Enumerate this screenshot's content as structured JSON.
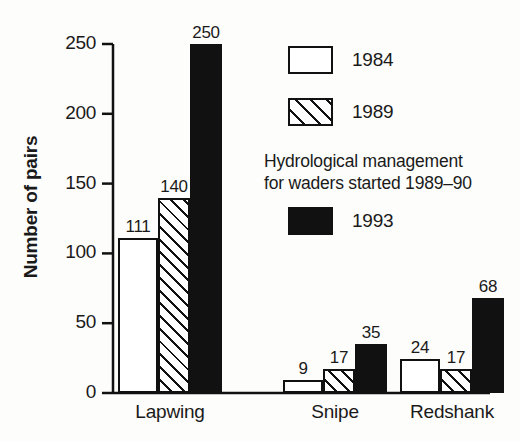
{
  "chart_data": {
    "type": "bar",
    "title": "",
    "xlabel": "",
    "ylabel": "Number of pairs",
    "ylim": [
      0,
      250
    ],
    "yticks": [
      0,
      50,
      100,
      150,
      200,
      250
    ],
    "grid": false,
    "legend_position": "upper-right-inside",
    "categories": [
      "Lapwing",
      "Snipe",
      "Redshank"
    ],
    "series": [
      {
        "name": "1984",
        "fill": "white",
        "values": [
          111,
          9,
          24
        ]
      },
      {
        "name": "1989",
        "fill": "hatched",
        "values": [
          140,
          17,
          17
        ]
      },
      {
        "name": "1993",
        "fill": "black",
        "values": [
          250,
          35,
          68
        ]
      }
    ],
    "annotations": [
      "Hydrological management",
      "for waders started 1989–90"
    ],
    "colors": {
      "ink": "#111111",
      "paper": "#ffffff",
      "background": "#fdfdfb"
    }
  }
}
